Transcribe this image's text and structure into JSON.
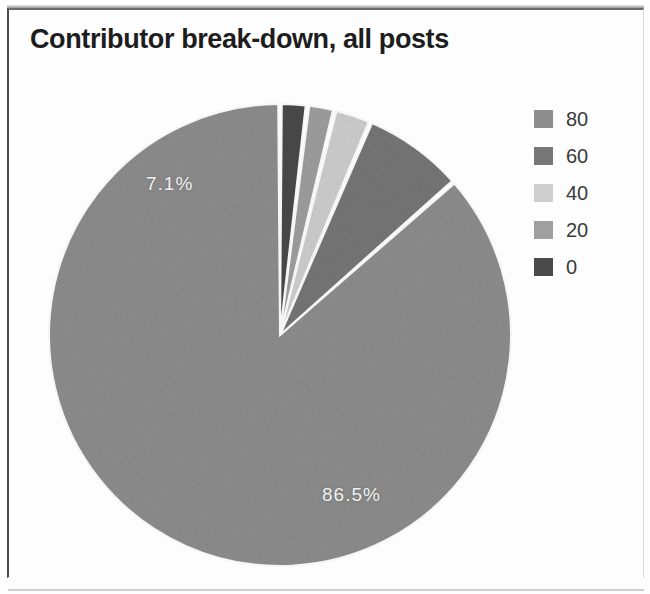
{
  "figure": {
    "title": "Contributor break-down, all posts",
    "background_color": "#fdfdfd",
    "frame_color": "#4a4a4a"
  },
  "chart_data": {
    "type": "pie",
    "title": "Contributor break-down, all posts",
    "xlabel": "",
    "ylabel": "",
    "grid": false,
    "legend_position": "right",
    "legend_entries": [
      "80",
      "60",
      "40",
      "20",
      "0"
    ],
    "categories": [
      "80",
      "60",
      "40",
      "20",
      "0"
    ],
    "labels": [
      "86.5%",
      "7.1%",
      "2.6%",
      "1.9%",
      "1.9%"
    ],
    "values": [
      86.5,
      7.1,
      2.6,
      1.9,
      1.9
    ],
    "value_unit": "%",
    "start_angle_deg": 90,
    "direction": "counterclockwise",
    "colors": [
      "#8e8e8e",
      "#777777",
      "#cfcfcf",
      "#9f9f9f",
      "#4a4a4a"
    ],
    "shown_data_labels": [
      {
        "text": "86.5%",
        "slice": "80"
      },
      {
        "text": "7.1%",
        "slice": "60"
      }
    ]
  },
  "slice_labels": {
    "major": "86.5%",
    "minor": "7.1%"
  },
  "legend": {
    "items": [
      {
        "label": "80",
        "color": "#8e8e8e"
      },
      {
        "label": "60",
        "color": "#777777"
      },
      {
        "label": "40",
        "color": "#cfcfcf"
      },
      {
        "label": "20",
        "color": "#9f9f9f"
      },
      {
        "label": "0",
        "color": "#4a4a4a"
      }
    ]
  }
}
